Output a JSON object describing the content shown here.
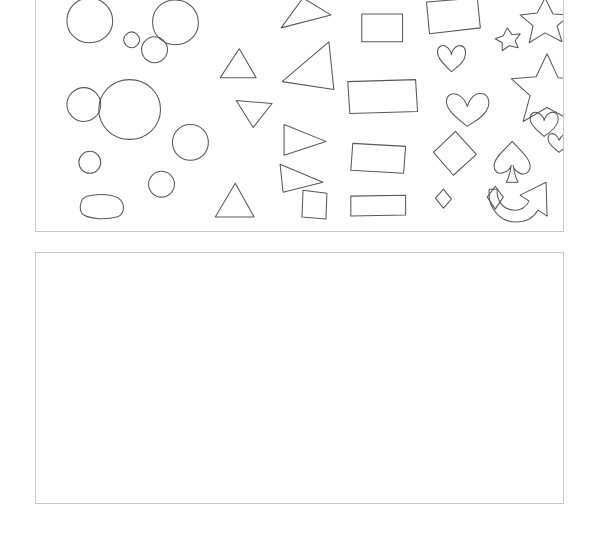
{
  "page": {
    "background_color": "#ffffff",
    "width": 597,
    "height": 538
  },
  "panels": [
    {
      "id": "shapes-panel",
      "name": "Shape Reference Panel",
      "label": "",
      "border_color": "#c9c9c9",
      "background_color": "#ffffff",
      "x": 35,
      "y": 0,
      "width": 529,
      "height": 232,
      "content_description": "Hand-drawn outline shapes arranged in columns",
      "stroke_color": "#58585c"
    },
    {
      "id": "drawing-panel",
      "name": "Blank Drawing Canvas",
      "label": "",
      "border_color": "#c9c9c9",
      "background_color": "#ffffff",
      "x": 35,
      "y": 252,
      "width": 529,
      "height": 252,
      "content_description": "Empty white canvas area",
      "stroke_color": "#58585c"
    }
  ],
  "shapes": [
    {
      "id": "circle-1",
      "kind": "circle",
      "label": "circle",
      "cx": 54,
      "cy": 23,
      "r": 23
    },
    {
      "id": "circle-2",
      "kind": "circle",
      "label": "circle",
      "cx": 140,
      "cy": 25,
      "r": 23
    },
    {
      "id": "circle-3",
      "kind": "circle",
      "label": "small circle",
      "cx": 96,
      "cy": 43,
      "r": 8
    },
    {
      "id": "circle-4",
      "kind": "circle",
      "label": "small circle",
      "cx": 119,
      "cy": 53,
      "r": 13
    },
    {
      "id": "circle-5",
      "kind": "circle",
      "label": "circle",
      "cx": 48,
      "cy": 108,
      "r": 17
    },
    {
      "id": "circle-6",
      "kind": "circle",
      "label": "large circle",
      "cx": 94,
      "cy": 113,
      "r": 30
    },
    {
      "id": "circle-7",
      "kind": "circle",
      "label": "circle",
      "cx": 155,
      "cy": 146,
      "r": 18
    },
    {
      "id": "circle-8",
      "kind": "circle",
      "label": "small circle",
      "cx": 54,
      "cy": 166,
      "r": 11
    },
    {
      "id": "circle-9",
      "kind": "circle",
      "label": "small circle",
      "cx": 126,
      "cy": 188,
      "r": 13
    },
    {
      "id": "circle-10",
      "kind": "rounded",
      "label": "rounded blob",
      "cx": 65,
      "cy": 209,
      "r": 17
    },
    {
      "id": "triangle-1",
      "kind": "triangle",
      "label": "triangle",
      "cx": 258,
      "cy": 15
    },
    {
      "id": "triangle-2",
      "kind": "triangle",
      "label": "triangle",
      "cx": 203,
      "cy": 66
    },
    {
      "id": "triangle-3",
      "kind": "triangle",
      "label": "triangle",
      "cx": 273,
      "cy": 70
    },
    {
      "id": "triangle-4",
      "kind": "triangle",
      "label": "triangle",
      "cx": 219,
      "cy": 117
    },
    {
      "id": "triangle-5",
      "kind": "triangle",
      "label": "triangle",
      "cx": 268,
      "cy": 142
    },
    {
      "id": "triangle-6",
      "kind": "triangle",
      "label": "triangle",
      "cx": 259,
      "cy": 182
    },
    {
      "id": "triangle-7",
      "kind": "triangle",
      "label": "triangle",
      "cx": 199,
      "cy": 206
    },
    {
      "id": "rect-1",
      "kind": "square",
      "label": "square",
      "cx": 347,
      "cy": 31
    },
    {
      "id": "rect-2",
      "kind": "rectangle",
      "label": "rectangle",
      "cx": 417,
      "cy": 19
    },
    {
      "id": "rect-3",
      "kind": "rectangle",
      "label": "rectangle",
      "cx": 349,
      "cy": 100
    },
    {
      "id": "rect-4",
      "kind": "rectangle",
      "label": "rectangle",
      "cx": 345,
      "cy": 162
    },
    {
      "id": "rect-5",
      "kind": "square",
      "label": "square",
      "cx": 280,
      "cy": 208
    },
    {
      "id": "rect-6",
      "kind": "rectangle",
      "label": "rectangle",
      "cx": 344,
      "cy": 210
    },
    {
      "id": "heart-1",
      "kind": "heart",
      "label": "heart",
      "cx": 417,
      "cy": 65
    },
    {
      "id": "heart-2",
      "kind": "heart",
      "label": "heart",
      "cx": 432,
      "cy": 115
    },
    {
      "id": "heart-3",
      "kind": "heart",
      "label": "heart",
      "cx": 510,
      "cy": 130
    },
    {
      "id": "heart-4",
      "kind": "heart",
      "label": "small heart",
      "cx": 525,
      "cy": 147
    },
    {
      "id": "star-1",
      "kind": "star",
      "label": "star",
      "cx": 511,
      "cy": 22
    },
    {
      "id": "star-2",
      "kind": "star",
      "label": "small star",
      "cx": 473,
      "cy": 41
    },
    {
      "id": "star-3",
      "kind": "star",
      "label": "large star",
      "cx": 513,
      "cy": 82
    },
    {
      "id": "diamond-1",
      "kind": "diamond",
      "label": "diamond",
      "cx": 419,
      "cy": 156
    },
    {
      "id": "diamond-2",
      "kind": "diamond",
      "label": "small diamond",
      "cx": 409,
      "cy": 202
    },
    {
      "id": "diamond-3",
      "kind": "diamond",
      "label": "small diamond",
      "cx": 461,
      "cy": 201
    },
    {
      "id": "spade-1",
      "kind": "spade",
      "label": "spade",
      "cx": 478,
      "cy": 165
    },
    {
      "id": "arrow-1",
      "kind": "arrow",
      "label": "curved arrow",
      "cx": 513,
      "cy": 207
    }
  ],
  "colors": {
    "stroke": "#58585c",
    "panel_border": "#c9c9c9",
    "background": "#ffffff"
  }
}
